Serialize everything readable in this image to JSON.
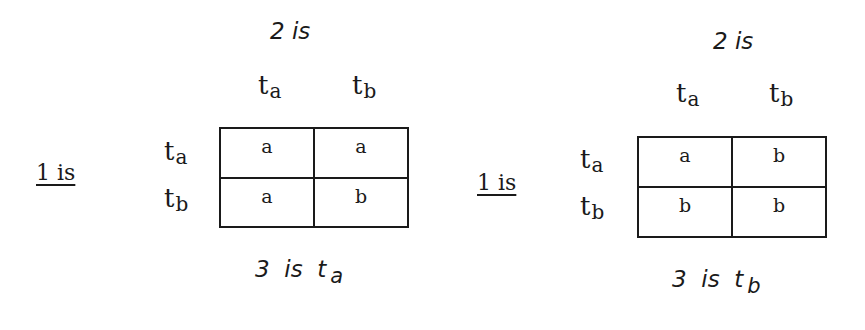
{
  "games": [
    {
      "player2_label": "2 is",
      "player1_label": "1 is",
      "columns": [
        "t",
        "t"
      ],
      "column_subs": [
        "a",
        "b"
      ],
      "rows": [
        "t",
        "t"
      ],
      "row_subs": [
        "a",
        "b"
      ],
      "cells": [
        [
          "a",
          "a"
        ],
        [
          "a",
          "b"
        ]
      ],
      "outcome_prefix": "3",
      "outcome_is": "is",
      "outcome_t": "t",
      "outcome_sub": "a"
    },
    {
      "player2_label": "2 is",
      "player1_label": "1 is",
      "columns": [
        "t",
        "t"
      ],
      "column_subs": [
        "a",
        "b"
      ],
      "rows": [
        "t",
        "t"
      ],
      "row_subs": [
        "a",
        "b"
      ],
      "cells": [
        [
          "a",
          "b"
        ],
        [
          "b",
          "b"
        ]
      ],
      "outcome_prefix": "3",
      "outcome_is": "is",
      "outcome_t": "t",
      "outcome_sub": "b"
    }
  ]
}
